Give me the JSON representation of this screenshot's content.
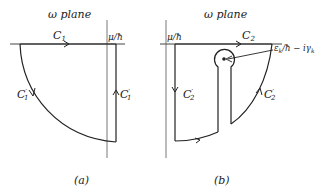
{
  "panel_a": {
    "plane_label": "ω plane",
    "contour_top": "C",
    "contour_top_sub": "1",
    "axis_mark": "μ/ħ",
    "left_arc": "C",
    "left_arc_sub": "1",
    "left_arc_prime": "′",
    "right_segment": "C",
    "right_segment_sub": "1",
    "right_segment_prime": "′",
    "caption": "(a)"
  },
  "panel_b": {
    "plane_label": "ω plane",
    "contour_top": "C",
    "contour_top_sub": "2",
    "axis_mark": "μ/ħ",
    "left_segment": "C",
    "left_segment_sub": "2",
    "left_segment_prime": "′",
    "right_arc": "C",
    "right_arc_sub": "2",
    "right_arc_prime": "′",
    "pole_label": "ε",
    "pole_label_sub1": "k",
    "pole_label_rest": "/ħ − iγ",
    "pole_label_sub2": "k",
    "caption": "(b)"
  },
  "colors": {
    "line": "#222222",
    "axis": "#444444",
    "background": "#ffffff"
  }
}
